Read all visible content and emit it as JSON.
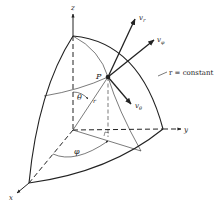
{
  "diagram": {
    "axes": {
      "x_label": "x",
      "y_label": "y",
      "z_label": "z"
    },
    "point_label": "P",
    "radius_label": "r",
    "angles": {
      "theta": "θ",
      "phi": "φ"
    },
    "vectors": {
      "v_r": {
        "base": "v",
        "sub": "r"
      },
      "v_phi": {
        "base": "v",
        "sub": "φ"
      },
      "v_theta": {
        "base": "v",
        "sub": "θ"
      }
    },
    "surface_label": "r = constant",
    "colors": {
      "line": "#222222",
      "background": "#ffffff"
    }
  }
}
